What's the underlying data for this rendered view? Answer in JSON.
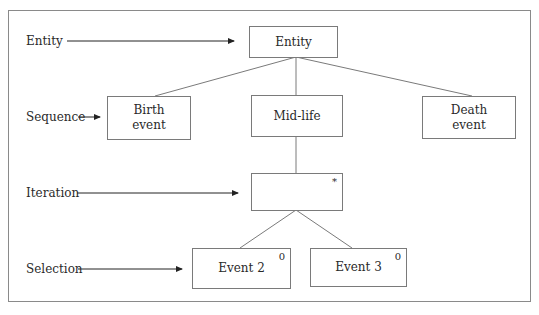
{
  "diagram": {
    "row_labels": [
      {
        "id": "entity",
        "text": "Entity"
      },
      {
        "id": "sequence",
        "text": "Sequence"
      },
      {
        "id": "iteration",
        "text": "Iteration"
      },
      {
        "id": "selection",
        "text": "Selection"
      }
    ],
    "nodes": [
      {
        "id": "entity",
        "text": "Entity",
        "marker": ""
      },
      {
        "id": "birth",
        "text": "Birth\nevent",
        "marker": ""
      },
      {
        "id": "midlife",
        "text": "Mid-life",
        "marker": ""
      },
      {
        "id": "death",
        "text": "Death\nevent",
        "marker": ""
      },
      {
        "id": "iteration",
        "text": "",
        "marker": "*"
      },
      {
        "id": "event2",
        "text": "Event 2",
        "marker": "0"
      },
      {
        "id": "event3",
        "text": "Event 3",
        "marker": "0"
      }
    ],
    "edges": [
      [
        "entity",
        "birth"
      ],
      [
        "entity",
        "midlife"
      ],
      [
        "entity",
        "death"
      ],
      [
        "midlife",
        "iteration"
      ],
      [
        "iteration",
        "event2"
      ],
      [
        "iteration",
        "event3"
      ]
    ],
    "colors": {
      "stroke": "#7a7a7a",
      "text": "#2a2a2a",
      "arrow": "#222222"
    }
  }
}
